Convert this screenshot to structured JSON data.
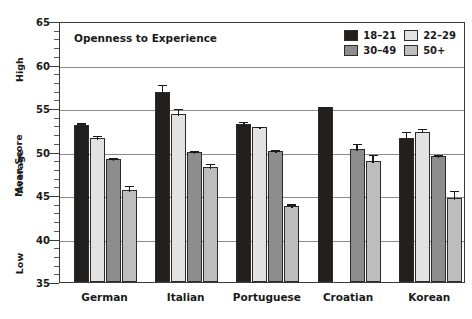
{
  "chart_data": {
    "type": "bar",
    "title": "Openness to Experience",
    "xlabel": "",
    "ylabel": "Mean Score",
    "ylim": [
      35,
      65
    ],
    "ytick_step": 5,
    "yticks": [
      65,
      60,
      55,
      50,
      45,
      40,
      35
    ],
    "ytick_labels": [
      "65",
      "60",
      "55",
      "50",
      "45",
      "40",
      "35"
    ],
    "minor_tick_step": 1,
    "grid": true,
    "grid_axis": "y",
    "legend_position": "top-right",
    "band_labels": {
      "high": "High",
      "average": "Average",
      "low": "Low"
    },
    "categories": [
      "German",
      "Italian",
      "Portuguese",
      "Croatian",
      "Korean"
    ],
    "series": [
      {
        "name": "18–21",
        "color": "#231f1d",
        "values": [
          53.0,
          56.8,
          53.2,
          55.1,
          51.5
        ],
        "errors": [
          0.45,
          1.1,
          0.45,
          0.3,
          1.0
        ]
      },
      {
        "name": "22–29",
        "color": "#e2e2e2",
        "values": [
          51.6,
          54.3,
          52.8,
          null,
          52.3
        ],
        "errors": [
          0.4,
          0.8,
          0.3,
          null,
          0.55
        ]
      },
      {
        "name": "30–49",
        "color": "#8d8d8d",
        "values": [
          49.1,
          49.9,
          50.1,
          50.3,
          49.5
        ],
        "errors": [
          0.35,
          0.35,
          0.25,
          0.8,
          0.3
        ]
      },
      {
        "name": "50+",
        "color": "#bdbdbd",
        "values": [
          45.6,
          48.2,
          43.7,
          48.9,
          44.7
        ],
        "errors": [
          0.65,
          0.6,
          0.45,
          0.95,
          1.0
        ]
      }
    ]
  },
  "legend": {
    "entries": [
      {
        "label": "18–21",
        "color": "#231f1d"
      },
      {
        "label": "22–29",
        "color": "#e2e2e2"
      },
      {
        "label": "30–49",
        "color": "#8d8d8d"
      },
      {
        "label": "50+",
        "color": "#bdbdbd"
      }
    ]
  },
  "colors": {
    "axis": "#3a3a3a",
    "grid": "#8a8a8a",
    "text": "#1a1a1a",
    "background": "#ffffff"
  }
}
